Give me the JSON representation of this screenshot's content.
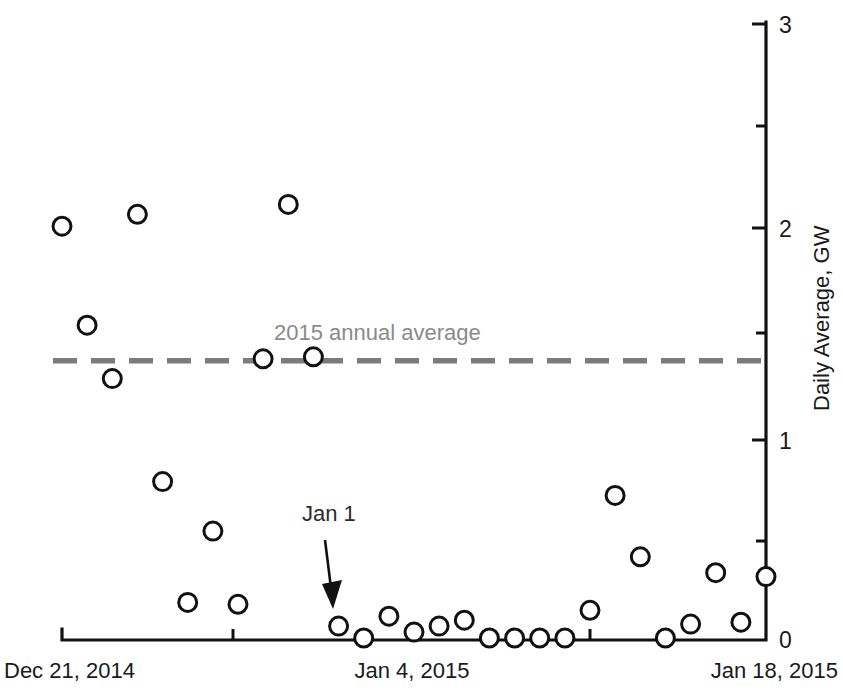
{
  "chart_data": {
    "type": "scatter",
    "title": "",
    "xlabel": "",
    "ylabel": "Daily Average, GW",
    "ylim": [
      0,
      3
    ],
    "yticks": [
      0,
      0.5,
      1,
      1.5,
      2,
      2.5,
      3
    ],
    "ytick_labels": [
      "0",
      "",
      "1",
      "",
      "2",
      "",
      "3"
    ],
    "xlim": [
      "Dec 21, 2014",
      "Jan 18, 2015"
    ],
    "xtick_labels": [
      "Dec 21, 2014",
      "",
      "Jan 4, 2015",
      "",
      "Jan 18, 2015"
    ],
    "grid": false,
    "legend": "none",
    "x": [
      "Dec 21, 2014",
      "Dec 22, 2014",
      "Dec 23, 2014",
      "Dec 24, 2014",
      "Dec 25, 2014",
      "Dec 26, 2014",
      "Dec 27, 2014",
      "Dec 28, 2014",
      "Dec 29, 2014",
      "Dec 30, 2014",
      "Dec 31, 2014",
      "Jan 1, 2015",
      "Jan 2, 2015",
      "Jan 3, 2015",
      "Jan 4, 2015",
      "Jan 5, 2015",
      "Jan 6, 2015",
      "Jan 7, 2015",
      "Jan 8, 2015",
      "Jan 9, 2015",
      "Jan 10, 2015",
      "Jan 11, 2015",
      "Jan 12, 2015",
      "Jan 13, 2015",
      "Jan 14, 2015",
      "Jan 15, 2015",
      "Jan 16, 2015",
      "Jan 17, 2015",
      "Jan 18, 2015"
    ],
    "values": [
      2.08,
      1.58,
      1.31,
      2.14,
      0.79,
      0.18,
      0.54,
      0.17,
      1.41,
      2.19,
      1.42,
      0.06,
      0.0,
      0.11,
      0.03,
      0.06,
      0.09,
      0.0,
      0.0,
      0.0,
      0.0,
      0.14,
      0.72,
      0.41,
      0.0,
      0.07,
      0.33,
      0.08,
      0.31
    ],
    "marker": "open-circle",
    "marker_size": 9,
    "reference_line": {
      "label": "2015 annual average",
      "value": 1.4,
      "style": "dashed",
      "color": "#7c7c7c"
    },
    "annotations": [
      {
        "label": "Jan 1",
        "points_to_x": "Jan 1, 2015",
        "points_to_y": 0.06
      }
    ]
  },
  "axis": {
    "y_title": "Daily Average, GW",
    "y_tick_3": "3",
    "y_tick_2": "2",
    "y_tick_1": "1",
    "y_tick_0": "0",
    "x_start_label": "Dec 21, 2014",
    "x_mid_label": "Jan 4, 2015",
    "x_end_label": "Jan 18, 2015"
  },
  "overlays": {
    "average_label": "2015 annual average",
    "jan1_label": "Jan 1"
  }
}
